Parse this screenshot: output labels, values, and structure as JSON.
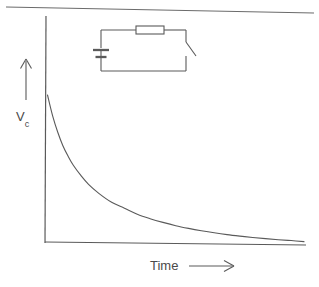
{
  "figure": {
    "title": "",
    "background_color": "#ffffff",
    "ink_color": "#555555",
    "width": 319,
    "height": 287
  },
  "axes": {
    "y_axis_label": "V",
    "y_axis_label_subscript": "c",
    "y_axis_label_full": "Vc",
    "x_axis_label": "Time",
    "x_axis_arrow": "right-arrow",
    "y_axis_arrow": "up-arrow",
    "origin_x": 45,
    "origin_y": 242,
    "x_axis_end": 306,
    "y_axis_top": 16
  },
  "circuit": {
    "name": "rc-discharge-circuit",
    "components": [
      {
        "type": "battery",
        "label": "",
        "position": "left"
      },
      {
        "type": "resistor",
        "label": "",
        "position": "top"
      },
      {
        "type": "switch",
        "label": "",
        "state": "open",
        "position": "right"
      }
    ],
    "box": {
      "left": 100,
      "top": 29,
      "right": 186,
      "bottom": 71
    }
  },
  "chart_data": {
    "type": "line",
    "title": "",
    "xlabel": "Time",
    "ylabel": "Vc",
    "grid": false,
    "legend": null,
    "legend_position": "none",
    "xlim": [
      0,
      1
    ],
    "ylim": [
      0,
      1
    ],
    "annotations": [
      "Time",
      "Vc"
    ],
    "series": [
      {
        "name": "Capacitor voltage decay",
        "description": "Exponential decay V = V0 * exp(-t/RC)",
        "x": [
          0.0,
          0.02,
          0.04,
          0.06,
          0.08,
          0.1,
          0.13,
          0.16,
          0.2,
          0.25,
          0.3,
          0.35,
          0.4,
          0.45,
          0.5,
          0.55,
          0.6,
          0.65,
          0.7,
          0.75,
          0.8,
          0.85,
          0.9,
          0.95,
          1.0
        ],
        "y": [
          1.0,
          0.86,
          0.75,
          0.66,
          0.59,
          0.53,
          0.46,
          0.4,
          0.34,
          0.28,
          0.24,
          0.2,
          0.17,
          0.145,
          0.123,
          0.105,
          0.089,
          0.075,
          0.063,
          0.053,
          0.044,
          0.036,
          0.029,
          0.023,
          0.016
        ]
      }
    ]
  }
}
